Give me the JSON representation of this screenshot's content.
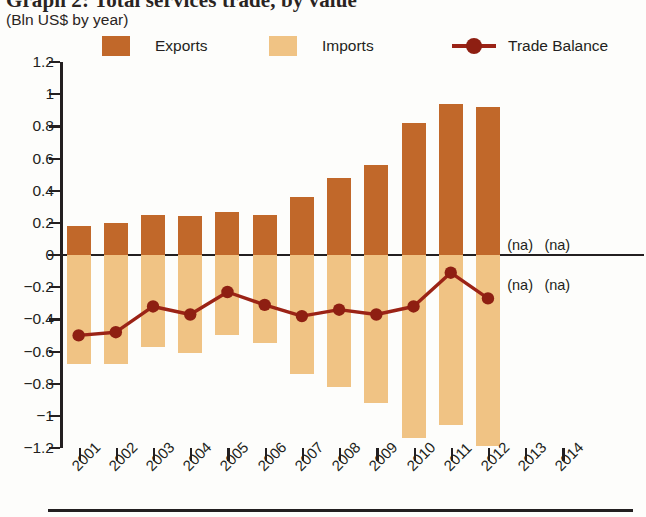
{
  "title": {
    "main": "Graph 2: Total services trade, by value",
    "sub": "(Bln US$ by year)"
  },
  "legend": {
    "position": "top",
    "items": [
      {
        "label": "Exports",
        "color": "#c1682a",
        "type": "bar"
      },
      {
        "label": "Imports",
        "color": "#f0c384",
        "type": "bar"
      },
      {
        "label": "Trade Balance",
        "color": "#9b2316",
        "type": "line"
      }
    ]
  },
  "annotations": {
    "na_label": "(na)",
    "notes": [
      {
        "text": "(na)",
        "year": "2013",
        "band": "above-zero"
      },
      {
        "text": "(na)",
        "year": "2014",
        "band": "above-zero"
      },
      {
        "text": "(na)",
        "year": "2013",
        "band": "below-zero"
      },
      {
        "text": "(na)",
        "year": "2014",
        "band": "below-zero"
      }
    ]
  },
  "axes": {
    "y_ticks": [
      "1.2",
      "1",
      "0.8",
      "0.6",
      "0.4",
      "0.2",
      "0",
      "-0.2",
      "-0.4",
      "-0.6",
      "-0.8",
      "-1",
      "-1.2"
    ],
    "x_ticks": [
      "2001",
      "2002",
      "2003",
      "2004",
      "2005",
      "2006",
      "2007",
      "2008",
      "2009",
      "2010",
      "2011",
      "2012",
      "2013",
      "2014"
    ]
  },
  "chart_data": {
    "type": "bar",
    "title": "Graph 2: Total services trade, by value",
    "subtitle": "(Bln US$ by year)",
    "xlabel": "",
    "ylabel": "Bln US$",
    "ylim": [
      -1.2,
      1.2
    ],
    "ytick_step": 0.2,
    "grid": false,
    "legend_position": "top",
    "categories": [
      "2001",
      "2002",
      "2003",
      "2004",
      "2005",
      "2006",
      "2007",
      "2008",
      "2009",
      "2010",
      "2011",
      "2012",
      "2013",
      "2014"
    ],
    "series": [
      {
        "name": "Exports",
        "type": "bar",
        "color": "#c1682a",
        "values": [
          0.18,
          0.2,
          0.25,
          0.24,
          0.27,
          0.25,
          0.36,
          0.48,
          0.56,
          0.82,
          0.94,
          0.92,
          null,
          null
        ]
      },
      {
        "name": "Imports",
        "type": "bar",
        "color": "#f0c384",
        "values": [
          -0.68,
          -0.68,
          -0.57,
          -0.61,
          -0.5,
          -0.55,
          -0.74,
          -0.82,
          -0.92,
          -1.14,
          -1.06,
          -1.19,
          null,
          null
        ]
      },
      {
        "name": "Trade Balance",
        "type": "line",
        "color": "#9b2316",
        "values": [
          -0.5,
          -0.48,
          -0.32,
          -0.37,
          -0.23,
          -0.31,
          -0.38,
          -0.34,
          -0.37,
          -0.32,
          -0.11,
          -0.27,
          null,
          null
        ]
      }
    ],
    "missing_data_label": "(na)",
    "missing_years": [
      "2013",
      "2014"
    ]
  }
}
